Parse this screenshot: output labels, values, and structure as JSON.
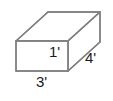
{
  "figure": {
    "kind": "rectangular-prism-diagram",
    "shape_name": "rectangular prism",
    "stroke_color": "#808080",
    "face_fill_color": "#ffffff",
    "background_color": "#ffffff",
    "label_color": "#1a1a1a"
  },
  "labels": {
    "height": "1'",
    "width": "3'",
    "depth": "4'"
  },
  "dimensions": [
    {
      "name": "height",
      "value": 1,
      "unit": "'",
      "text": "1'",
      "edge": "front-vertical-right"
    },
    {
      "name": "width",
      "value": 3,
      "unit": "'",
      "text": "3'",
      "edge": "front-bottom"
    },
    {
      "name": "depth",
      "value": 4,
      "unit": "'",
      "text": "4'",
      "edge": "right-diagonal"
    }
  ],
  "geometry": {
    "front_top_left": [
      16,
      41
    ],
    "front_top_right": [
      68,
      41
    ],
    "front_bottom_right": [
      68,
      71
    ],
    "front_bottom_left": [
      16,
      71
    ],
    "back_top_left": [
      48,
      12
    ],
    "back_top_right": [
      100,
      12
    ],
    "back_bottom_right": [
      100,
      42
    ]
  }
}
